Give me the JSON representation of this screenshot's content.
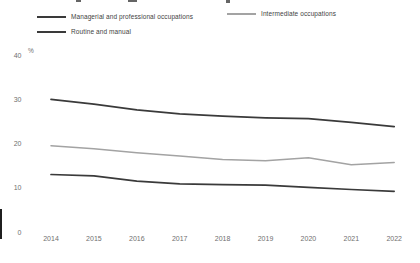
{
  "colors": {
    "background": "#ffffff",
    "dark_line": "#3a3a3a",
    "gray_line": "#a3a3a3",
    "axis_text": "#6f6f6f",
    "legend_text": "#3f3f3f"
  },
  "legend": {
    "items": [
      {
        "label": "Managerial and professional occupations",
        "color": "#3a3a3a"
      },
      {
        "label": "Intermediate occupations",
        "color": "#a3a3a3"
      },
      {
        "label": "Routine and manual",
        "color": "#3a3a3a"
      }
    ]
  },
  "chart_data": {
    "type": "line",
    "x": [
      2014,
      2015,
      2016,
      2017,
      2018,
      2019,
      2020,
      2021,
      2022
    ],
    "series": [
      {
        "name": "Managerial and professional occupations",
        "color": "#3a3a3a",
        "values": [
          30.0,
          28.9,
          27.6,
          26.7,
          26.2,
          25.8,
          25.6,
          24.8,
          23.8
        ]
      },
      {
        "name": "Intermediate occupations",
        "color": "#a3a3a3",
        "values": [
          19.5,
          18.8,
          17.9,
          17.2,
          16.4,
          16.1,
          16.8,
          15.2,
          15.7
        ]
      },
      {
        "name": "Routine and manual",
        "color": "#3a3a3a",
        "values": [
          13.0,
          12.7,
          11.5,
          10.9,
          10.7,
          10.6,
          10.1,
          9.6,
          9.2
        ]
      }
    ],
    "title": "",
    "xlabel": "",
    "ylabel": "%",
    "yticks": [
      0,
      10,
      20,
      30,
      40
    ],
    "ylim": [
      0,
      40
    ],
    "grid": false,
    "legend_position": "top"
  }
}
